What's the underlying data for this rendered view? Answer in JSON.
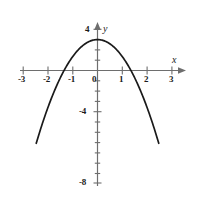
{
  "figure": {
    "background_color": "#ffffff",
    "curve_color": "#1a1a1a",
    "axis_color": "#6e6e6e",
    "label_color": "#1a1a1a"
  },
  "axes": {
    "x_axis_label": "x",
    "y_axis_label": "y",
    "x_ticks": [
      {
        "label": "-3",
        "value": -3
      },
      {
        "label": "-2",
        "value": -2
      },
      {
        "label": "-1",
        "value": -1
      },
      {
        "label": "0",
        "value": 0
      },
      {
        "label": "1",
        "value": 1
      },
      {
        "label": "2",
        "value": 2
      },
      {
        "label": "3",
        "value": 3
      }
    ],
    "y_ticks": [
      {
        "label": "4",
        "value": 4
      },
      {
        "label": "-4",
        "value": -4
      },
      {
        "label": "-8",
        "value": -8
      }
    ]
  },
  "chart_data": {
    "type": "line",
    "title": "",
    "xlabel": "x",
    "ylabel": "y",
    "xlim": [
      -3,
      3
    ],
    "ylim": [
      -8,
      4
    ],
    "grid": false,
    "legend": "none",
    "x_ticks": [
      -3,
      -2,
      -1,
      0,
      1,
      2,
      3
    ],
    "x_tick_labels": [
      "-3",
      "-2",
      "-1",
      "0",
      "1",
      "2",
      "3"
    ],
    "y_ticks": [
      4,
      -4,
      -8
    ],
    "y_tick_labels": [
      "4",
      "-4",
      "-8"
    ],
    "y_minor_ticks": [
      3,
      2,
      1,
      -1,
      -2,
      -3,
      -5,
      -6,
      -7
    ],
    "series": [
      {
        "name": "parabola",
        "equation": "y = 3 - 1.65x^2",
        "vertex": [
          0,
          3
        ],
        "roots": [
          -1.35,
          1.35
        ],
        "x": [
          -2.47,
          -2.2,
          -2.0,
          -1.75,
          -1.5,
          -1.35,
          -1.0,
          -0.75,
          -0.5,
          -0.25,
          0,
          0.25,
          0.5,
          0.75,
          1.0,
          1.35,
          1.5,
          1.75,
          2.0,
          2.2,
          2.47
        ],
        "values": [
          -7.06,
          -4.99,
          -3.6,
          -2.05,
          -0.71,
          0,
          1.35,
          2.07,
          2.59,
          2.9,
          3.0,
          2.9,
          2.59,
          2.07,
          1.35,
          0,
          -0.71,
          -2.05,
          -3.6,
          -4.99,
          -7.06
        ]
      }
    ]
  }
}
